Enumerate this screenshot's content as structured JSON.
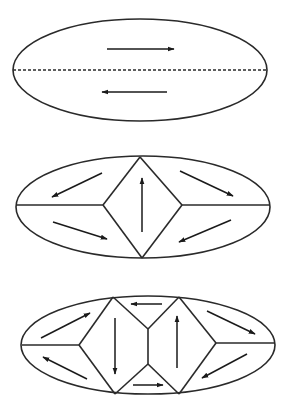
{
  "diagram": {
    "colors": {
      "stroke": "#2a2a2a",
      "background": "#ffffff"
    },
    "panels": [
      {
        "id": "panel-1",
        "ellipse": {
          "cx": 140,
          "cy": 70,
          "rx": 127,
          "ry": 51
        },
        "lines": [
          {
            "x1": 13,
            "y1": 70,
            "x2": 267,
            "y2": 70,
            "style": "dashed"
          }
        ],
        "arrows": [
          {
            "x1": 107,
            "y1": 49,
            "x2": 174,
            "y2": 49,
            "direction": "right"
          },
          {
            "x1": 167,
            "y1": 92,
            "x2": 102,
            "y2": 92,
            "direction": "left"
          }
        ]
      },
      {
        "id": "panel-2",
        "ellipse": {
          "cx": 143,
          "cy": 207,
          "rx": 127,
          "ry": 51
        },
        "lines": [
          {
            "x1": 17,
            "y1": 205,
            "x2": 103,
            "y2": 205
          },
          {
            "x1": 182,
            "y1": 205,
            "x2": 270,
            "y2": 205
          },
          {
            "x1": 140,
            "y1": 157,
            "x2": 103,
            "y2": 205
          },
          {
            "x1": 103,
            "y1": 205,
            "x2": 142,
            "y2": 258
          },
          {
            "x1": 140,
            "y1": 157,
            "x2": 182,
            "y2": 205
          },
          {
            "x1": 182,
            "y1": 205,
            "x2": 142,
            "y2": 258
          }
        ],
        "arrows": [
          {
            "x1": 102,
            "y1": 173,
            "x2": 52,
            "y2": 197,
            "direction": "down-left"
          },
          {
            "x1": 53,
            "y1": 222,
            "x2": 107,
            "y2": 239,
            "direction": "down-right"
          },
          {
            "x1": 142,
            "y1": 232,
            "x2": 142,
            "y2": 178,
            "direction": "up"
          },
          {
            "x1": 180,
            "y1": 171,
            "x2": 233,
            "y2": 196,
            "direction": "down-right"
          },
          {
            "x1": 231,
            "y1": 220,
            "x2": 179,
            "y2": 242,
            "direction": "down-left"
          }
        ]
      },
      {
        "id": "panel-3",
        "ellipse": {
          "cx": 148,
          "cy": 345,
          "rx": 127,
          "ry": 49
        },
        "lines": [
          {
            "x1": 22,
            "y1": 345,
            "x2": 79,
            "y2": 345
          },
          {
            "x1": 216,
            "y1": 343,
            "x2": 275,
            "y2": 343
          },
          {
            "x1": 113,
            "y1": 297,
            "x2": 79,
            "y2": 345
          },
          {
            "x1": 79,
            "y1": 345,
            "x2": 115,
            "y2": 394
          },
          {
            "x1": 113,
            "y1": 297,
            "x2": 148,
            "y2": 329
          },
          {
            "x1": 148,
            "y1": 329,
            "x2": 179,
            "y2": 297
          },
          {
            "x1": 148,
            "y1": 329,
            "x2": 148,
            "y2": 364
          },
          {
            "x1": 115,
            "y1": 394,
            "x2": 148,
            "y2": 364
          },
          {
            "x1": 148,
            "y1": 364,
            "x2": 179,
            "y2": 394
          },
          {
            "x1": 179,
            "y1": 297,
            "x2": 216,
            "y2": 343
          },
          {
            "x1": 216,
            "y1": 343,
            "x2": 179,
            "y2": 394
          }
        ],
        "arrows": [
          {
            "x1": 41,
            "y1": 338,
            "x2": 90,
            "y2": 313,
            "direction": "up-right"
          },
          {
            "x1": 87,
            "y1": 379,
            "x2": 43,
            "y2": 357,
            "direction": "up-left"
          },
          {
            "x1": 115,
            "y1": 318,
            "x2": 115,
            "y2": 374,
            "direction": "down"
          },
          {
            "x1": 162,
            "y1": 304,
            "x2": 131,
            "y2": 304,
            "direction": "left"
          },
          {
            "x1": 133,
            "y1": 385,
            "x2": 163,
            "y2": 385,
            "direction": "right"
          },
          {
            "x1": 177,
            "y1": 368,
            "x2": 177,
            "y2": 316,
            "direction": "up"
          },
          {
            "x1": 207,
            "y1": 311,
            "x2": 255,
            "y2": 334,
            "direction": "down-right"
          },
          {
            "x1": 247,
            "y1": 354,
            "x2": 202,
            "y2": 378,
            "direction": "down-left"
          }
        ]
      }
    ]
  }
}
